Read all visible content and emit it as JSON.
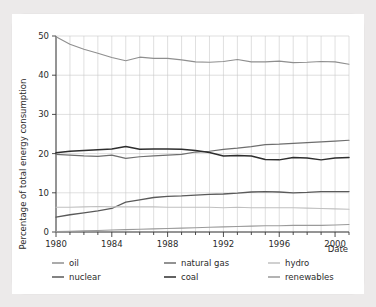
{
  "chart_data": {
    "type": "line",
    "title": "",
    "xlabel": "Date",
    "ylabel": "Percentage of total energy consumption",
    "xlim": [
      1980,
      2001
    ],
    "ylim": [
      0,
      50
    ],
    "grid": true,
    "legend_position": "bottom",
    "legend_columns": 3,
    "x_tick_labels": [
      "1980",
      "1984",
      "1988",
      "1992",
      "1996",
      "2000"
    ],
    "x_ticks": [
      1980,
      1984,
      1988,
      1992,
      1996,
      2000
    ],
    "x_minor_tick_step": 1,
    "y_tick_labels": [
      "0",
      "10",
      "20",
      "30",
      "40",
      "50"
    ],
    "y_ticks": [
      0,
      10,
      20,
      30,
      40,
      50
    ],
    "x": [
      1980,
      1981,
      1982,
      1983,
      1984,
      1985,
      1986,
      1987,
      1988,
      1989,
      1990,
      1991,
      1992,
      1993,
      1994,
      1995,
      1996,
      1997,
      1998,
      1999,
      2000,
      2001
    ],
    "series": [
      {
        "name": "oil",
        "color": "#8f8f8f",
        "width": 1.1,
        "values": [
          49.8,
          47.9,
          46.6,
          45.6,
          44.5,
          43.7,
          44.6,
          44.3,
          44.3,
          43.9,
          43.4,
          43.3,
          43.5,
          44.0,
          43.4,
          43.4,
          43.6,
          43.2,
          43.3,
          43.5,
          43.4,
          42.8
        ]
      },
      {
        "name": "natural gas",
        "color": "#6e6e6e",
        "width": 1.2,
        "values": [
          19.8,
          19.6,
          19.4,
          19.3,
          19.6,
          18.8,
          19.2,
          19.4,
          19.6,
          19.8,
          20.4,
          20.6,
          21.1,
          21.4,
          21.8,
          22.3,
          22.4,
          22.6,
          22.8,
          23.0,
          23.2,
          23.4
        ]
      },
      {
        "name": "coal",
        "color": "#2e2e2e",
        "width": 1.5,
        "values": [
          20.2,
          20.6,
          20.8,
          21.0,
          21.2,
          21.8,
          21.1,
          21.2,
          21.2,
          21.1,
          20.8,
          20.3,
          19.4,
          19.5,
          19.4,
          18.5,
          18.4,
          19.0,
          18.9,
          18.4,
          18.9,
          19.0
        ]
      },
      {
        "name": "nuclear",
        "color": "#5a5a5a",
        "width": 1.3,
        "values": [
          3.8,
          4.4,
          4.9,
          5.4,
          6.0,
          7.6,
          8.2,
          8.8,
          9.1,
          9.2,
          9.4,
          9.6,
          9.7,
          9.9,
          10.2,
          10.3,
          10.2,
          10.0,
          10.1,
          10.3,
          10.3,
          10.3
        ]
      },
      {
        "name": "hydro",
        "color": "#c0c0c0",
        "width": 1.1,
        "values": [
          6.3,
          6.3,
          6.4,
          6.5,
          6.4,
          6.4,
          6.4,
          6.4,
          6.3,
          6.3,
          6.3,
          6.3,
          6.2,
          6.3,
          6.2,
          6.2,
          6.2,
          6.2,
          6.1,
          6.0,
          5.9,
          5.8
        ]
      },
      {
        "name": "renewables",
        "color": "#9a9a9a",
        "width": 1.1,
        "values": [
          0.1,
          0.2,
          0.3,
          0.4,
          0.5,
          0.6,
          0.7,
          0.8,
          0.9,
          1.0,
          1.1,
          1.2,
          1.3,
          1.4,
          1.5,
          1.6,
          1.6,
          1.7,
          1.7,
          1.7,
          1.8,
          1.9
        ]
      }
    ]
  },
  "legend": {
    "items": [
      {
        "label": "oil"
      },
      {
        "label": "natural gas"
      },
      {
        "label": "hydro"
      },
      {
        "label": "nuclear"
      },
      {
        "label": "coal"
      },
      {
        "label": "renewables"
      }
    ]
  }
}
